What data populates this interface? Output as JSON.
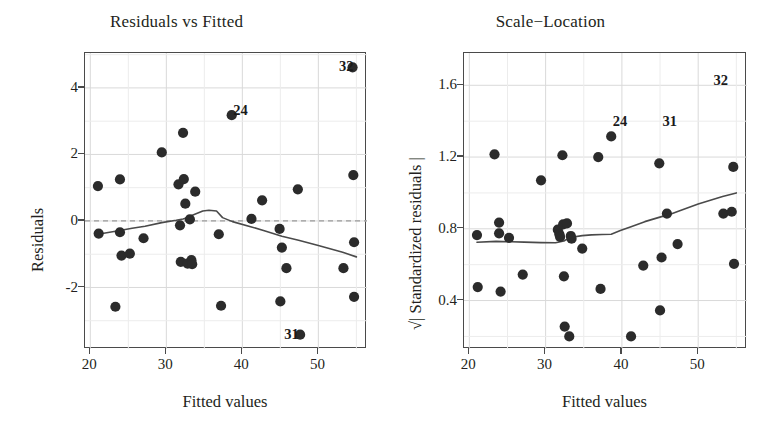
{
  "figure": {
    "background": "#ffffff",
    "point_color": "#2b2b2b",
    "line_color": "#4a4a4a",
    "grid_color": "#d9d9d9",
    "frame_color": "#4a4a4a"
  },
  "chart_data": [
    {
      "type": "scatter",
      "panel": "left",
      "title": "Residuals vs Fitted",
      "xlabel": "Fitted values",
      "ylabel": "Residuals",
      "xlim": [
        19.3,
        56.4
      ],
      "ylim": [
        -3.85,
        5.05
      ],
      "xticks": [
        20,
        30,
        40,
        50
      ],
      "yticks": [
        -2,
        0,
        2,
        4
      ],
      "grid": true,
      "reference_line": {
        "y": 0,
        "style": "dashed"
      },
      "smoother": {
        "name": "loess",
        "x": [
          21.0,
          23.5,
          25.5,
          27.2,
          29.4,
          31.3,
          32.2,
          33.0,
          33.5,
          34.8,
          35.6,
          36.6,
          37.4,
          38.7,
          41.2,
          43.0,
          45.2,
          47.4,
          50.0,
          53.2,
          55.0
        ],
        "y": [
          -0.4,
          -0.3,
          -0.22,
          -0.16,
          -0.05,
          0.02,
          0.06,
          0.12,
          0.18,
          0.3,
          0.32,
          0.3,
          0.1,
          -0.02,
          -0.18,
          -0.3,
          -0.46,
          -0.58,
          -0.74,
          -0.94,
          -1.08
        ]
      },
      "points": [
        {
          "x": 21.0,
          "y": 1.05
        },
        {
          "x": 21.1,
          "y": -0.38
        },
        {
          "x": 23.3,
          "y": -2.58
        },
        {
          "x": 23.9,
          "y": 1.25
        },
        {
          "x": 23.9,
          "y": -0.34
        },
        {
          "x": 24.1,
          "y": -1.04
        },
        {
          "x": 25.2,
          "y": -0.98
        },
        {
          "x": 27.0,
          "y": -0.52
        },
        {
          "x": 29.4,
          "y": 2.06
        },
        {
          "x": 31.6,
          "y": 1.1
        },
        {
          "x": 31.8,
          "y": -0.13
        },
        {
          "x": 31.9,
          "y": -1.23
        },
        {
          "x": 32.2,
          "y": 2.65
        },
        {
          "x": 32.3,
          "y": 1.26
        },
        {
          "x": 32.5,
          "y": 0.52
        },
        {
          "x": 32.8,
          "y": -1.28
        },
        {
          "x": 33.1,
          "y": 0.05
        },
        {
          "x": 33.3,
          "y": -1.18
        },
        {
          "x": 33.4,
          "y": -1.3
        },
        {
          "x": 33.8,
          "y": 0.88
        },
        {
          "x": 36.9,
          "y": -0.4
        },
        {
          "x": 37.2,
          "y": -2.55
        },
        {
          "x": 38.6,
          "y": 3.18
        },
        {
          "x": 41.2,
          "y": 0.06
        },
        {
          "x": 42.6,
          "y": 0.62
        },
        {
          "x": 44.9,
          "y": -0.24
        },
        {
          "x": 45.0,
          "y": -2.42
        },
        {
          "x": 45.2,
          "y": -0.8
        },
        {
          "x": 45.8,
          "y": -1.42
        },
        {
          "x": 47.3,
          "y": 0.95
        },
        {
          "x": 47.6,
          "y": -3.42
        },
        {
          "x": 53.3,
          "y": -1.42
        },
        {
          "x": 54.6,
          "y": 1.38
        },
        {
          "x": 54.7,
          "y": -0.64
        },
        {
          "x": 54.7,
          "y": -2.28
        },
        {
          "x": 54.5,
          "y": 4.62
        }
      ],
      "annotations": [
        {
          "label": "32",
          "x": 53.8,
          "y": 4.62
        },
        {
          "label": "24",
          "x": 39.9,
          "y": 3.32
        },
        {
          "label": "31",
          "x": 46.6,
          "y": -3.42
        }
      ]
    },
    {
      "type": "scatter",
      "panel": "right",
      "title": "Scale−Location",
      "xlabel": "Fitted values",
      "ylabel": "√| Standardized residuals |",
      "xlim": [
        19.3,
        56.4
      ],
      "ylim": [
        0.13,
        1.78
      ],
      "xticks": [
        20,
        30,
        40,
        50
      ],
      "yticks": [
        0.4,
        0.8,
        1.2,
        1.6
      ],
      "grid": true,
      "smoother": {
        "name": "loess",
        "x": [
          21.0,
          23.5,
          25.5,
          27.2,
          29.4,
          31.3,
          32.4,
          33.2,
          34.8,
          36.0,
          37.4,
          38.6,
          39.8,
          41.2,
          43.0,
          45.2,
          46.0,
          47.4,
          50.0,
          53.2,
          55.0
        ],
        "y": [
          0.725,
          0.73,
          0.728,
          0.726,
          0.723,
          0.722,
          0.732,
          0.752,
          0.762,
          0.766,
          0.768,
          0.77,
          0.79,
          0.812,
          0.84,
          0.868,
          0.876,
          0.898,
          0.938,
          0.98,
          1.0
        ]
      },
      "points": [
        {
          "x": 21.0,
          "y": 0.765
        },
        {
          "x": 21.1,
          "y": 0.475
        },
        {
          "x": 23.3,
          "y": 1.215
        },
        {
          "x": 23.9,
          "y": 0.835
        },
        {
          "x": 23.9,
          "y": 0.775
        },
        {
          "x": 24.1,
          "y": 0.45
        },
        {
          "x": 25.2,
          "y": 0.75
        },
        {
          "x": 27.0,
          "y": 0.545
        },
        {
          "x": 29.4,
          "y": 1.07
        },
        {
          "x": 31.6,
          "y": 0.795
        },
        {
          "x": 31.8,
          "y": 0.77
        },
        {
          "x": 31.9,
          "y": 0.755
        },
        {
          "x": 32.2,
          "y": 1.21
        },
        {
          "x": 32.3,
          "y": 0.825
        },
        {
          "x": 32.4,
          "y": 0.535
        },
        {
          "x": 32.5,
          "y": 0.255
        },
        {
          "x": 32.8,
          "y": 0.83
        },
        {
          "x": 33.1,
          "y": 0.2
        },
        {
          "x": 33.3,
          "y": 0.76
        },
        {
          "x": 33.4,
          "y": 0.745
        },
        {
          "x": 34.8,
          "y": 0.69
        },
        {
          "x": 36.9,
          "y": 1.2
        },
        {
          "x": 37.2,
          "y": 0.465
        },
        {
          "x": 38.6,
          "y": 1.315
        },
        {
          "x": 41.2,
          "y": 0.2
        },
        {
          "x": 42.8,
          "y": 0.595
        },
        {
          "x": 44.9,
          "y": 1.165
        },
        {
          "x": 45.0,
          "y": 0.345
        },
        {
          "x": 45.2,
          "y": 0.64
        },
        {
          "x": 45.9,
          "y": 0.885
        },
        {
          "x": 47.3,
          "y": 0.715
        },
        {
          "x": 53.3,
          "y": 0.885
        },
        {
          "x": 54.4,
          "y": 0.895
        },
        {
          "x": 54.6,
          "y": 1.145
        },
        {
          "x": 54.7,
          "y": 0.605
        }
      ],
      "annotations": [
        {
          "label": "24",
          "x": 39.9,
          "y": 1.395
        },
        {
          "label": "31",
          "x": 46.4,
          "y": 1.395
        },
        {
          "label": "32",
          "x": 53.1,
          "y": 1.625
        }
      ]
    }
  ]
}
